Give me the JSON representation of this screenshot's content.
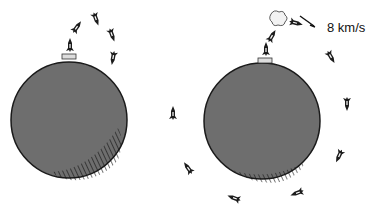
{
  "illustration": {
    "description": "Two planets: left shows rockets launched and falling back; right shows rocket reaching orbital velocity and circling the planet",
    "colors": {
      "planet_fill": "#6e6e6e",
      "planet_stroke": "#1a1a1a",
      "rocket": "#1c1c1c",
      "background": "#ffffff"
    },
    "left_planet": {
      "center": [
        69,
        120
      ],
      "radius": 58,
      "rockets": [
        {
          "x": 70,
          "y": 45,
          "angle": 0
        },
        {
          "x": 77,
          "y": 27,
          "angle": 35
        },
        {
          "x": 96,
          "y": 19,
          "angle": 160
        },
        {
          "x": 112,
          "y": 35,
          "angle": 160
        },
        {
          "x": 113,
          "y": 58,
          "angle": 190
        }
      ]
    },
    "right_planet": {
      "center": [
        262,
        121
      ],
      "radius": 58,
      "rockets": [
        {
          "x": 266,
          "y": 49,
          "angle": 0
        },
        {
          "x": 272,
          "y": 36,
          "angle": 30
        },
        {
          "x": 296,
          "y": 23,
          "angle": 105
        },
        {
          "x": 331,
          "y": 57,
          "angle": 150
        },
        {
          "x": 347,
          "y": 104,
          "angle": 180
        },
        {
          "x": 339,
          "y": 156,
          "angle": 205
        },
        {
          "x": 297,
          "y": 193,
          "angle": 250
        },
        {
          "x": 234,
          "y": 198,
          "angle": 290
        },
        {
          "x": 188,
          "y": 168,
          "angle": 325
        },
        {
          "x": 173,
          "y": 113,
          "angle": 0
        }
      ]
    },
    "speed_label": "8 km/s"
  }
}
